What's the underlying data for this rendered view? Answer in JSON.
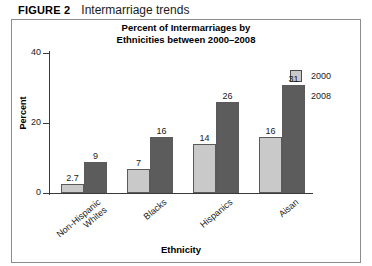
{
  "figure": {
    "number": "FIGURE 2",
    "caption": "Intermarriage trends"
  },
  "chart_data": {
    "type": "bar",
    "title": "Percent of Intermarriages by Ethnicities between 2000–2008",
    "title_lines": [
      "Percent of Intermarriages by",
      "Ethnicities between 2000–2008"
    ],
    "xlabel": "Ethnicity",
    "ylabel": "Percent",
    "ylim": [
      0,
      40
    ],
    "yticks": [
      0,
      20,
      40
    ],
    "ytick_labels": [
      "0",
      "20",
      "40"
    ],
    "grid": false,
    "legend_position": "top-right",
    "categories": [
      "Non-Hispanic Whites",
      "Blacks",
      "Hispanics",
      "Aisan"
    ],
    "category_lines": [
      [
        "Non-Hispanic",
        "Whites"
      ],
      [
        "Blacks"
      ],
      [
        "Hispanics"
      ],
      [
        "Aisan"
      ]
    ],
    "series": [
      {
        "name": "2000",
        "color": "#c9c9c9",
        "values": [
          2.7,
          7,
          14,
          16
        ],
        "value_labels": [
          "2.7",
          "7",
          "14",
          "16"
        ]
      },
      {
        "name": "2008",
        "color": "#5c5c5c",
        "values": [
          9,
          16,
          26,
          31
        ],
        "value_labels": [
          "9",
          "16",
          "26",
          "31"
        ]
      }
    ]
  }
}
